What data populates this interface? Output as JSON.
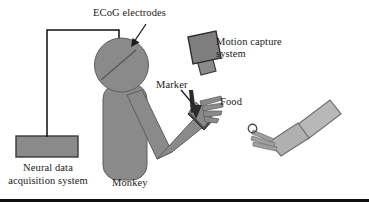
{
  "figure": {
    "width": 369,
    "height": 202,
    "background": "#ffffff",
    "rule_color": "#100f0f"
  },
  "colors": {
    "monkey_gray": "#8a8a8a",
    "monkey_outline": "#575757",
    "device_gray": "#8a8a8a",
    "device_outline": "#3c3c3c",
    "human_arm_gray": "#b8b8b8",
    "human_arm_outline": "#6e6e6e",
    "marker_dark": "#2e2e2e",
    "wire_black": "#0f0f0f",
    "text_color": "#1a1a1a"
  },
  "labels": {
    "ecog": "ECoG electrodes",
    "motion_capture_line1": "Motion capture",
    "motion_capture_line2": "system",
    "marker": "Marker",
    "food": "Food",
    "neural_line1": "Neural data",
    "neural_line2": "acquisition system",
    "monkey": "Monkey"
  },
  "icons": {
    "ecog_pointer": "arrow-icon",
    "marker_pointer": "arrow-icon",
    "camera": "camera-icon",
    "amplifier": "box-icon",
    "monkey_head": "circle-icon",
    "food_item": "circle-icon"
  }
}
